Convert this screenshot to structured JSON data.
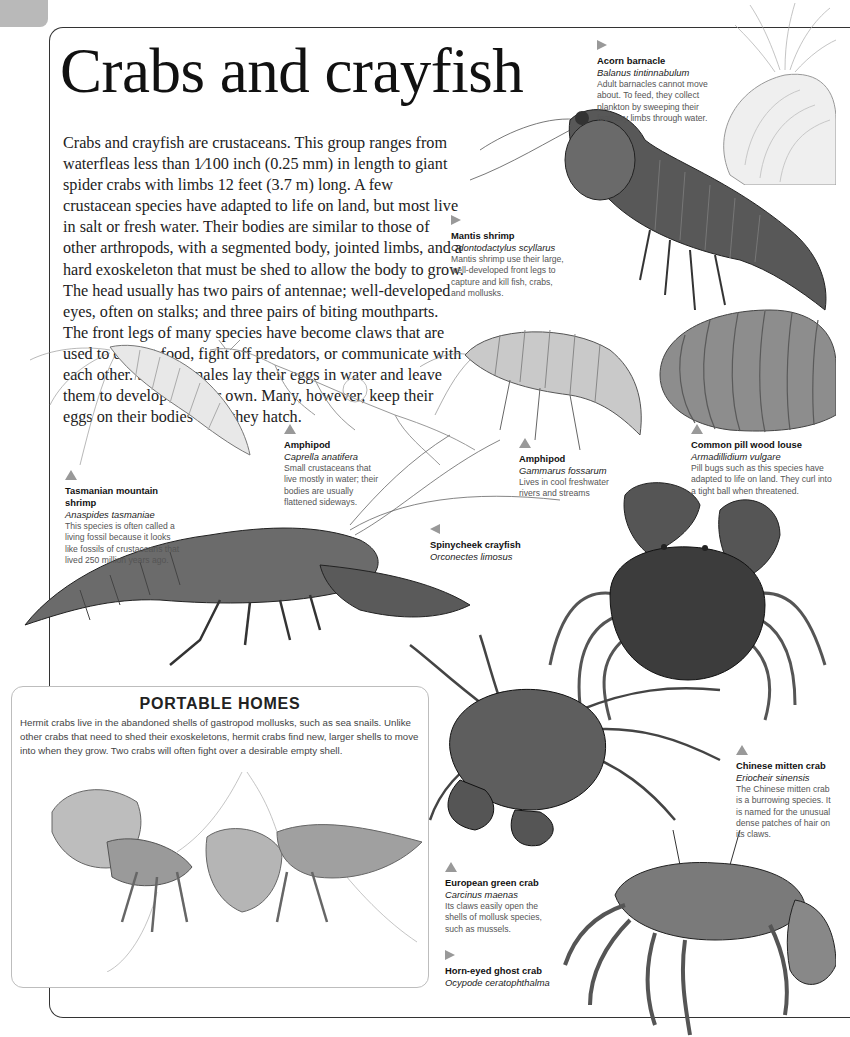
{
  "page": {
    "title": "Crabs and crayfish",
    "intro": "Crabs and crayfish are crustaceans. This group ranges from waterfleas less than 1⁄100 inch (0.25 mm) in length to giant spider crabs with limbs 12 feet (3.7 m) long. A few crustacean species have adapted to life on land, but most live in salt or fresh water. Their bodies are similar to those of other arthropods, with a segmented body, jointed limbs, and a hard exoskeleton that must be shed to allow the body to grow. The head usually has two pairs of antennae; well-developed eyes, often on stalks; and three pairs of biting mouthparts. The front legs of many species have become claws that are used to collect food, fight off predators, or communicate with each other. Some females lay their eggs in water and leave them to develop on their own. Many, however, keep their eggs on their bodies until they hatch."
  },
  "species": [
    {
      "id": "acorn-barnacle",
      "arrow": "right",
      "name": "Acorn barnacle",
      "scientific": "Balanus tintinnabulum",
      "description": "Adult barnacles cannot move about. To feed, they collect plankton by sweeping their feathery limbs through water."
    },
    {
      "id": "mantis-shrimp",
      "arrow": "right",
      "name": "Mantis shrimp",
      "scientific": "Odontodactylus scyllarus",
      "description": "Mantis shrimp use their large, well-developed front legs to capture and kill fish, crabs, and mollusks."
    },
    {
      "id": "tasmanian-mountain-shrimp",
      "arrow": "up",
      "name": "Tasmanian mountain shrimp",
      "scientific": "Anaspides tasmaniae",
      "description": "This species is often called a living fossil because it looks like fossils of crustaceans that lived 250 million years ago."
    },
    {
      "id": "amphipod-caprella",
      "arrow": "up",
      "name": "Amphipod",
      "scientific": "Caprella anatifera",
      "description": "Small crustaceans that live mostly in water; their bodies are usually flattened sideways."
    },
    {
      "id": "amphipod-gammarus",
      "arrow": "up",
      "name": "Amphipod",
      "scientific": "Gammarus fossarum",
      "description": "Lives in cool freshwater rivers and streams"
    },
    {
      "id": "common-pill-wood-louse",
      "arrow": "up",
      "name": "Common pill wood louse",
      "scientific": "Armadillidium vulgare",
      "description": "Pill bugs such as this species have adapted to life on land. They curl into a tight ball when threatened."
    },
    {
      "id": "spinycheek-crayfish",
      "arrow": "left",
      "name": "Spinycheek crayfish",
      "scientific": "Orconectes limosus",
      "description": ""
    },
    {
      "id": "chinese-mitten-crab",
      "arrow": "up",
      "name": "Chinese mitten crab",
      "scientific": "Eriocheir sinensis",
      "description": "The Chinese mitten crab is a burrowing species. It is named for the unusual dense patches of hair on its claws."
    },
    {
      "id": "european-green-crab",
      "arrow": "up",
      "name": "European green crab",
      "scientific": "Carcinus maenas",
      "description": "Its claws easily open the shells of mollusk species, such as mussels."
    },
    {
      "id": "horn-eyed-ghost-crab",
      "arrow": "right",
      "name": "Horn-eyed ghost crab",
      "scientific": "Ocypode ceratophthalma",
      "description": ""
    }
  ],
  "sidebar": {
    "heading": "PORTABLE HOMES",
    "text": "Hermit crabs live in the abandoned shells of gastropod mollusks, such as sea snails. Unlike other crabs that need to shed their exoskeletons, hermit crabs find new, larger shells to move into when they grow. Two crabs will often fight over a desirable empty shell."
  },
  "colors": {
    "frame": "#333333",
    "page_tab": "#b9b9b9",
    "caption_arrow": "#999999",
    "sidebar_border": "#bdbdbd"
  }
}
